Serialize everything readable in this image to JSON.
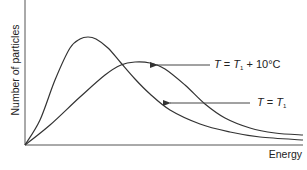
{
  "chart_data": {
    "type": "line",
    "title": "",
    "xlabel": "Energy",
    "ylabel": "Number of particles",
    "grid": false,
    "legend": "none (inline annotations with arrows)",
    "axis_ticks": "none",
    "series": [
      {
        "name": "T = T1",
        "annotation": {
          "var": "T",
          "eq": "=",
          "rhs_var": "T",
          "rhs_sub": "1",
          "suffix": ""
        },
        "peak": {
          "x_px": 88,
          "y_px": 37
        },
        "points_px": [
          [
            25,
            145
          ],
          [
            40,
            120
          ],
          [
            55,
            80
          ],
          [
            70,
            48
          ],
          [
            80,
            39
          ],
          [
            88,
            37
          ],
          [
            96,
            39
          ],
          [
            108,
            48
          ],
          [
            121,
            63
          ],
          [
            135,
            79
          ],
          [
            150,
            94
          ],
          [
            170,
            110
          ],
          [
            200,
            124
          ],
          [
            230,
            132
          ],
          [
            260,
            137
          ],
          [
            303,
            140
          ]
        ]
      },
      {
        "name": "T = T1 + 10°C",
        "annotation": {
          "var": "T",
          "eq": "=",
          "rhs_var": "T",
          "rhs_sub": "1",
          "suffix": " + 10°C"
        },
        "peak": {
          "x_px": 135,
          "y_px": 62
        },
        "points_px": [
          [
            25,
            145
          ],
          [
            50,
            125
          ],
          [
            80,
            97
          ],
          [
            105,
            75
          ],
          [
            121,
            65
          ],
          [
            135,
            62
          ],
          [
            150,
            63
          ],
          [
            165,
            69
          ],
          [
            185,
            85
          ],
          [
            205,
            104
          ],
          [
            225,
            118
          ],
          [
            250,
            128
          ],
          [
            275,
            133
          ],
          [
            303,
            135
          ]
        ]
      }
    ],
    "annotations": [
      {
        "target": "T = T1 + 10°C",
        "arrow_from": [
          210,
          65
        ],
        "arrow_to": [
          157,
          65
        ]
      },
      {
        "target": "T = T1",
        "arrow_from": [
          250,
          103
        ],
        "arrow_to": [
          170,
          103
        ]
      }
    ],
    "axes": {
      "origin_px": [
        25,
        145
      ],
      "x_end_px": 303,
      "y_top_px": 0
    }
  },
  "labels": {
    "xlabel": "Energy",
    "ylabel": "Number of particles",
    "hot": {
      "var": "T",
      "eq": " = ",
      "rhs_var": "T",
      "rhs_sub": "1",
      "suffix": " + 10°C"
    },
    "cold": {
      "var": "T",
      "eq": " = ",
      "rhs_var": "T",
      "rhs_sub": "1"
    }
  },
  "colors": {
    "axis": "#333333",
    "curve": "#333333",
    "arrow": "#444444",
    "text": "#222222"
  }
}
